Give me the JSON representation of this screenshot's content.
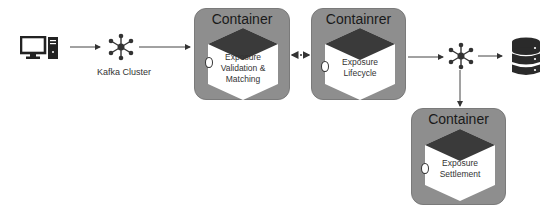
{
  "diagram": {
    "nodes": {
      "client": {
        "icon": "desktop-computer-icon"
      },
      "kafka": {
        "icon": "hub-network-icon",
        "label": "Kafka Cluster"
      },
      "container1": {
        "title": "Container",
        "service_line1": "Exposure",
        "service_line2": "Validation &",
        "service_line3": "Matching"
      },
      "container2": {
        "title": "Containrer",
        "service_line1": "Exposure",
        "service_line2": "Lifecycle"
      },
      "hub2": {
        "icon": "hub-network-icon"
      },
      "database": {
        "icon": "database-icon"
      },
      "container3": {
        "title": "Container",
        "service_line1": "Exposure",
        "service_line2": "Settlement"
      }
    },
    "edges": [
      {
        "from": "client",
        "to": "kafka",
        "style": "solid"
      },
      {
        "from": "kafka",
        "to": "container1",
        "style": "solid"
      },
      {
        "from": "container1",
        "to": "container2",
        "style": "dotted-bidirectional"
      },
      {
        "from": "container2",
        "to": "hub2",
        "style": "solid"
      },
      {
        "from": "hub2",
        "to": "database",
        "style": "solid"
      },
      {
        "from": "hub2",
        "to": "container3",
        "style": "solid"
      }
    ],
    "colors": {
      "container_bg": "#8e8e8e",
      "cube_top": "#3a3a3a",
      "cube_body": "#ffffff",
      "icon": "#222222"
    }
  }
}
